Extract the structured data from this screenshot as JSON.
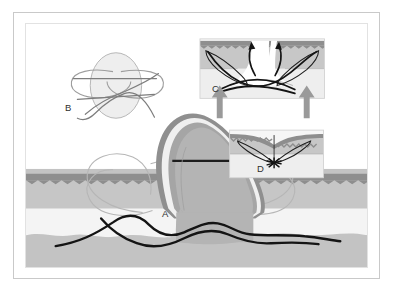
{
  "figure": {
    "panels": [
      {
        "id": "A",
        "label": "A",
        "caption": "Elevated tissue flap over layered skin cross-section with passing suture"
      },
      {
        "id": "B",
        "label": "B",
        "caption": "Suture loop configuration over an elliptical excision outline"
      },
      {
        "id": "C",
        "label": "C",
        "caption": "Wound cross-section, wound edges everted, approximating forces applied"
      },
      {
        "id": "D",
        "label": "D",
        "caption": "Closed wound with buried knot at the deep apex"
      }
    ]
  },
  "colors": {
    "epidermis": "#8c8c8c",
    "dermis": "#c0c0c0",
    "subcutaneous": "#f2f2f2",
    "muscle": "#bdbdbd",
    "flap_fill": "#b4b4b4",
    "flap_rim": "#8f8f8f",
    "flap_highlight": "#f0f0f0",
    "suture_dark": "#141414",
    "suture_light": "#b9b9b9",
    "arrow_gray": "#9a9a9a",
    "frame_outer": "#c9c9c9",
    "frame_inner": "#e2e2e2",
    "label_text": "#2e2e2e",
    "background": "#ffffff"
  },
  "panel_A": {
    "label": "A",
    "elements": {
      "flap": "elevated-tissue-flap",
      "flap_cut_line": "horizontal-dark-incision-line",
      "suture_loops": "light-gray-suture-loops",
      "suture_thread": "dark-running-suture-thread",
      "layers": [
        "epidermis",
        "dermis",
        "subcutaneous-fat",
        "deep-fascia-muscle"
      ]
    }
  },
  "panel_B": {
    "label": "B",
    "elements": {
      "ellipse": "elliptical-excision-outline",
      "loops": "crossed-suture-loops",
      "tail": "suture-tail"
    }
  },
  "panel_C": {
    "label": "C",
    "elements": {
      "skin_block": "skin-cross-section-block",
      "wound_gap": "open-wound-gap",
      "eversion_arrows": [
        "curved-arrow-left",
        "curved-arrow-right"
      ],
      "approximation_arrows": [
        "gray-arrow-left",
        "gray-arrow-right"
      ],
      "suture_loops": "buried-suture-loops",
      "suture_thread": "dark-suture-thread"
    }
  },
  "panel_D": {
    "label": "D",
    "elements": {
      "skin_block": "skin-cross-section-block",
      "closure_line": "vertical-closure-line",
      "suture_loops": "buried-suture-loops",
      "knot": "buried-knot-star"
    }
  }
}
